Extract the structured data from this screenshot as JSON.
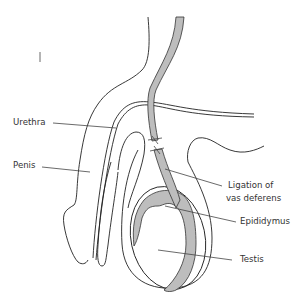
{
  "diagram": {
    "labels": [
      {
        "id": "urethra",
        "text": "Urethra"
      },
      {
        "id": "penis",
        "text": "Penis"
      },
      {
        "id": "ligation_line1",
        "text": "Ligation of"
      },
      {
        "id": "ligation_line2",
        "text": "vas deferens"
      },
      {
        "id": "epididymus",
        "text": "Epididymus"
      },
      {
        "id": "testis",
        "text": "Testis"
      }
    ],
    "colors": {
      "outline": "#222222",
      "fill_gray": "#bdbdbd",
      "background": "#ffffff"
    }
  }
}
